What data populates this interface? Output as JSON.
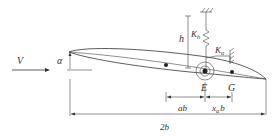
{
  "diagram": {
    "labels": {
      "velocity": "V",
      "pitch_angle": "α",
      "plunge": "h",
      "plunge_spring": "K",
      "plunge_spring_sub": "h",
      "pitch_spring": "K",
      "pitch_spring_sub": "α",
      "elastic_axis": "E",
      "center_of_gravity": "G",
      "elastic_axis_offset": "ab",
      "cg_offset_x": "x",
      "cg_offset_sub": "α",
      "cg_offset_b": "b",
      "chord": "2b"
    },
    "elements": [
      {
        "id": "freestream-arrow",
        "label": "V"
      },
      {
        "id": "airfoil",
        "label": "airfoil section"
      },
      {
        "id": "pitch-angle",
        "label": "α"
      },
      {
        "id": "plunge-spring",
        "label": "Kh"
      },
      {
        "id": "torsion-spring",
        "label": "Kα"
      },
      {
        "id": "elastic-axis-point",
        "label": "E"
      },
      {
        "id": "cg-point",
        "label": "G"
      },
      {
        "id": "chord-dimension",
        "label": "2b"
      }
    ],
    "colors": {
      "line": "#333333",
      "background": "#ffffff"
    }
  }
}
